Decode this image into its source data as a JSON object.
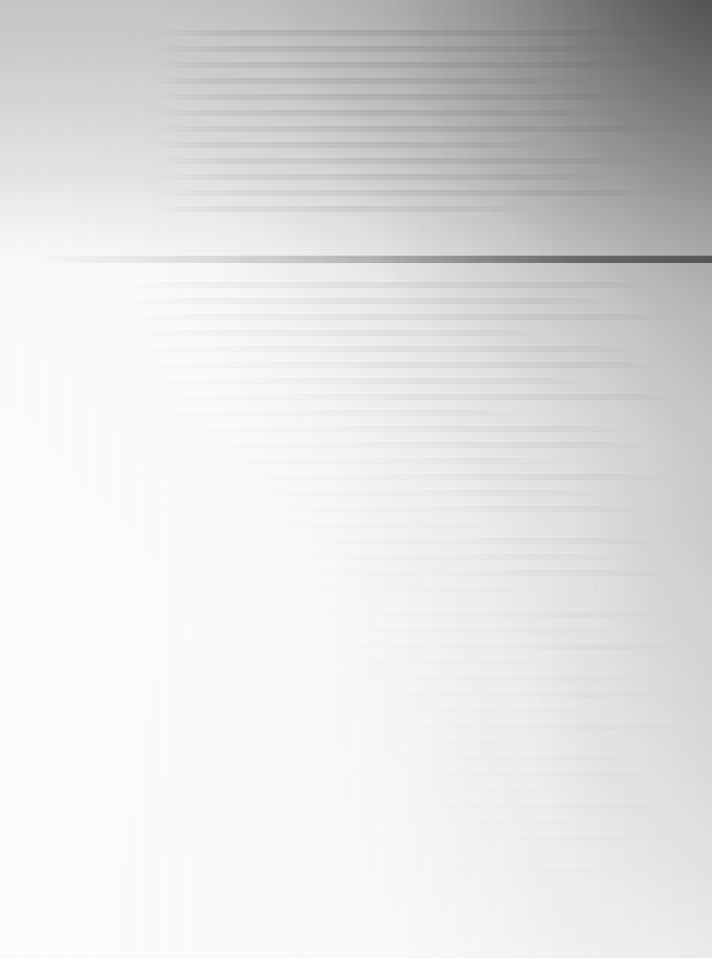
{
  "page": {
    "width": 712,
    "height": 958,
    "kind": "overexposed-blank-document-scan",
    "legible_text": "",
    "note": "No legible text is rendered anywhere in the image."
  },
  "background": {
    "base_color": "#fcfcfc",
    "bright_corner_color": "#ffffff",
    "dark_corner_color": "#464646",
    "top_right_corner_color": "#4a4a4a",
    "top_left_corner_color": "#ffffff",
    "bottom_right_corner_color": "#f2f2f2",
    "bottom_left_corner_color": "#ffffff",
    "gradient_direction": "white at lower-left to dark gray at upper-right"
  },
  "separator_rule": {
    "top": 256,
    "height": 7,
    "left": 0,
    "width": 712,
    "fade_in_x": 40,
    "left_color": "#ffffff",
    "mid_color": "#6e6e6e",
    "right_color": "#121212"
  },
  "ghost_rows": {
    "description": "faint residual horizontal text-line artifacts, no characters resolvable",
    "line_pitch": 16,
    "line_thickness": 6,
    "blocks": [
      {
        "left": 150,
        "top": 30,
        "width": 560,
        "lines": 12
      },
      {
        "left": 112,
        "top": 282,
        "width": 596,
        "lines": 20
      },
      {
        "left": 196,
        "top": 612,
        "width": 512,
        "lines": 18
      }
    ]
  }
}
